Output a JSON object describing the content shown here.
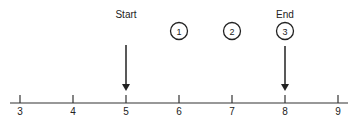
{
  "diagram": {
    "type": "number-line",
    "ticks": [
      {
        "value": "3",
        "x": 20
      },
      {
        "value": "4",
        "x": 73
      },
      {
        "value": "5",
        "x": 126
      },
      {
        "value": "6",
        "x": 179
      },
      {
        "value": "7",
        "x": 232
      },
      {
        "value": "8",
        "x": 285
      },
      {
        "value": "9",
        "x": 338
      }
    ],
    "start": {
      "label": "Start",
      "at": "5"
    },
    "end": {
      "label": "End",
      "at": "8"
    },
    "steps": [
      {
        "label": "1",
        "at": "6"
      },
      {
        "label": "2",
        "at": "7"
      },
      {
        "label": "3",
        "at": "8"
      }
    ],
    "colors": {
      "line": "#222222",
      "background": "#ffffff"
    }
  }
}
